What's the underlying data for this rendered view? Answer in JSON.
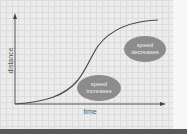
{
  "diagram": {
    "axes": {
      "x_label": "time",
      "y_label": "distance"
    },
    "curve": {
      "shape": "S-curve (sigmoid)",
      "description": "distance rises slowly, then steeply, then levels off"
    },
    "annotations": {
      "speed_decreases": {
        "line1": "speed",
        "line2": "decreases"
      },
      "speed_increases": {
        "line1": "speed",
        "line2": "increases"
      }
    },
    "colors": {
      "grid_background": "#ececec",
      "grid_lines": "#dcdcdc",
      "axis": "#555555",
      "curve": "#4a4a4a",
      "bubble_fill": "#8c8c8c",
      "bubble_text": "#ececec",
      "bottom_bar": "#5a5a5a"
    }
  }
}
